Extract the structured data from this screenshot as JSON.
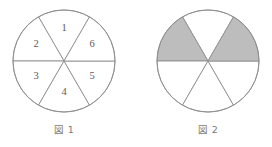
{
  "page": {
    "background_color": "#ffffff",
    "width": 272,
    "height": 147
  },
  "style": {
    "stroke_color": "#8e8e8e",
    "stroke_width": 0.9,
    "fill_white": "#ffffff",
    "fill_shaded": "#bdbdbd",
    "number_color": "#5a5a5a",
    "caption_color": "#7b7b7b"
  },
  "figures": [
    {
      "id": "figure-1",
      "caption": "図 1",
      "caption_x": 64,
      "caption_y": 130,
      "center_x": 64,
      "center_y": 61,
      "radius": 51,
      "sector_count": 6,
      "sectors": [
        {
          "label": "1",
          "start_angle": 60,
          "end_angle": 120,
          "shaded": false,
          "label_x": 64,
          "label_y": 29
        },
        {
          "label": "2",
          "start_angle": 120,
          "end_angle": 180,
          "shaded": false,
          "label_x": 36,
          "label_y": 45
        },
        {
          "label": "3",
          "start_angle": 180,
          "end_angle": 240,
          "shaded": false,
          "label_x": 36,
          "label_y": 77
        },
        {
          "label": "4",
          "start_angle": 240,
          "end_angle": 300,
          "shaded": false,
          "label_x": 64,
          "label_y": 93
        },
        {
          "label": "5",
          "start_angle": 300,
          "end_angle": 360,
          "shaded": false,
          "label_x": 92,
          "label_y": 77
        },
        {
          "label": "6",
          "start_angle": 0,
          "end_angle": 60,
          "shaded": false,
          "label_x": 92,
          "label_y": 45
        }
      ]
    },
    {
      "id": "figure-2",
      "caption": "図 2",
      "caption_x": 208,
      "caption_y": 130,
      "center_x": 208,
      "center_y": 61,
      "radius": 51,
      "sector_count": 6,
      "sectors": [
        {
          "label": "",
          "start_angle": 60,
          "end_angle": 120,
          "shaded": false,
          "label_x": 208,
          "label_y": 29
        },
        {
          "label": "",
          "start_angle": 120,
          "end_angle": 180,
          "shaded": true,
          "label_x": 180,
          "label_y": 45
        },
        {
          "label": "",
          "start_angle": 180,
          "end_angle": 240,
          "shaded": false,
          "label_x": 180,
          "label_y": 77
        },
        {
          "label": "",
          "start_angle": 240,
          "end_angle": 300,
          "shaded": false,
          "label_x": 208,
          "label_y": 93
        },
        {
          "label": "",
          "start_angle": 300,
          "end_angle": 360,
          "shaded": false,
          "label_x": 236,
          "label_y": 77
        },
        {
          "label": "",
          "start_angle": 0,
          "end_angle": 60,
          "shaded": true,
          "label_x": 236,
          "label_y": 45
        }
      ]
    }
  ]
}
